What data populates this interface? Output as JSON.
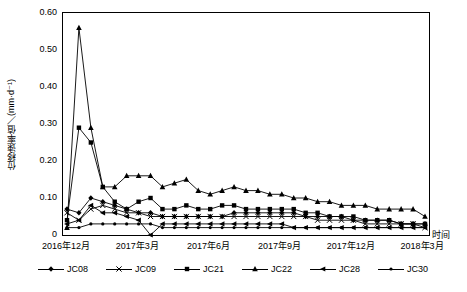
{
  "chart_data": {
    "type": "line",
    "title": "",
    "xlabel": "时间",
    "ylabel": "位移速率值／(mm·d⁻¹)",
    "ylim": [
      0,
      0.6
    ],
    "yticks": [
      "0",
      "0.10",
      "0.20",
      "0.30",
      "0.40",
      "0.50",
      "0.60"
    ],
    "xticks": [
      "2016年12月",
      "2017年3月",
      "2017年6月",
      "2017年9月",
      "2017年12月",
      "2018年3月"
    ],
    "grid": false,
    "legend_position": "bottom",
    "series": [
      {
        "name": "JC08",
        "marker": "diamond",
        "x": [
          0,
          1,
          2,
          3,
          4,
          5,
          6,
          7,
          8,
          9,
          10,
          11,
          12,
          13,
          14,
          15,
          16,
          17,
          18,
          19,
          20,
          21,
          22,
          23,
          24,
          25,
          26,
          27,
          28,
          29,
          30
        ],
        "values": [
          0.07,
          0.06,
          0.1,
          0.09,
          0.08,
          0.07,
          0.06,
          0.06,
          0.05,
          0.05,
          0.05,
          0.05,
          0.05,
          0.05,
          0.06,
          0.06,
          0.06,
          0.06,
          0.06,
          0.06,
          0.05,
          0.05,
          0.05,
          0.05,
          0.04,
          0.04,
          0.04,
          0.04,
          0.03,
          0.03,
          0.03
        ]
      },
      {
        "name": "JC09",
        "marker": "x",
        "x": [
          0,
          1,
          2,
          3,
          4,
          5,
          6,
          7,
          8,
          9,
          10,
          11,
          12,
          13,
          14,
          15,
          16,
          17,
          18,
          19,
          20,
          21,
          22,
          23,
          24,
          25,
          26,
          27,
          28,
          29,
          30
        ],
        "values": [
          0.06,
          0.04,
          0.07,
          0.08,
          0.07,
          0.06,
          0.06,
          0.05,
          0.05,
          0.05,
          0.05,
          0.05,
          0.05,
          0.05,
          0.05,
          0.05,
          0.05,
          0.05,
          0.05,
          0.05,
          0.05,
          0.04,
          0.04,
          0.04,
          0.04,
          0.03,
          0.03,
          0.03,
          0.03,
          0.03,
          0.02
        ]
      },
      {
        "name": "JC21",
        "marker": "square",
        "x": [
          0,
          1,
          2,
          3,
          4,
          5,
          6,
          7,
          8,
          9,
          10,
          11,
          12,
          13,
          14,
          15,
          16,
          17,
          18,
          19,
          20,
          21,
          22,
          23,
          24,
          25,
          26,
          27,
          28,
          29,
          30
        ],
        "values": [
          0.04,
          0.29,
          0.25,
          0.13,
          0.09,
          0.07,
          0.09,
          0.1,
          0.07,
          0.07,
          0.08,
          0.07,
          0.07,
          0.08,
          0.08,
          0.07,
          0.07,
          0.07,
          0.07,
          0.07,
          0.06,
          0.06,
          0.05,
          0.05,
          0.05,
          0.04,
          0.04,
          0.04,
          0.03,
          0.03,
          0.03
        ]
      },
      {
        "name": "JC22",
        "marker": "triangle",
        "x": [
          0,
          1,
          2,
          3,
          4,
          5,
          6,
          7,
          8,
          9,
          10,
          11,
          12,
          13,
          14,
          15,
          16,
          17,
          18,
          19,
          20,
          21,
          22,
          23,
          24,
          25,
          26,
          27,
          28,
          29,
          30
        ],
        "values": [
          0.02,
          0.56,
          0.29,
          0.13,
          0.13,
          0.16,
          0.16,
          0.16,
          0.13,
          0.14,
          0.15,
          0.12,
          0.11,
          0.12,
          0.13,
          0.12,
          0.12,
          0.11,
          0.11,
          0.1,
          0.1,
          0.09,
          0.09,
          0.08,
          0.08,
          0.08,
          0.07,
          0.07,
          0.07,
          0.07,
          0.05
        ]
      },
      {
        "name": "JC28",
        "marker": "left-triangle",
        "x": [
          0,
          1,
          2,
          3,
          4,
          5,
          6,
          7,
          8,
          9,
          10,
          11,
          12,
          13,
          14,
          15,
          16,
          17,
          18,
          19,
          20,
          21,
          22,
          23,
          24,
          25,
          26,
          27,
          28,
          29,
          30
        ],
        "values": [
          0.03,
          0.04,
          0.08,
          0.06,
          0.06,
          0.05,
          0.04,
          0.0,
          0.03,
          0.03,
          0.03,
          0.03,
          0.03,
          0.03,
          0.03,
          0.03,
          0.03,
          0.03,
          0.03,
          0.02,
          0.02,
          0.02,
          0.02,
          0.02,
          0.02,
          0.02,
          0.02,
          0.02,
          0.02,
          0.02,
          0.02
        ]
      },
      {
        "name": "JC30",
        "marker": "dot",
        "x": [
          0,
          1,
          2,
          3,
          4,
          5,
          6,
          7,
          8,
          9,
          10,
          11,
          12,
          13,
          14,
          15,
          16,
          17,
          18,
          19,
          20,
          21,
          22,
          23,
          24,
          25,
          26,
          27,
          28,
          29,
          30
        ],
        "values": [
          0.02,
          0.02,
          0.03,
          0.03,
          0.03,
          0.03,
          0.03,
          0.03,
          0.02,
          0.02,
          0.02,
          0.02,
          0.02,
          0.02,
          0.02,
          0.02,
          0.02,
          0.02,
          0.02,
          0.02,
          0.02,
          0.02,
          0.02,
          0.02,
          0.02,
          0.02,
          0.02,
          0.02,
          0.02,
          0.02,
          0.02
        ]
      }
    ]
  },
  "axis": {
    "ylabel": "位移速率值／(mm·d⁻¹)",
    "xlabel": "时间",
    "yticks": [
      "0.60",
      "0.50",
      "0.40",
      "0.30",
      "0.20",
      "0.10",
      "0"
    ],
    "xticks": [
      "2016年12月",
      "2017年3月",
      "2017年6月",
      "2017年9月",
      "2017年12月",
      "2018年3月"
    ]
  },
  "legend": {
    "items": [
      {
        "label": "JC08",
        "marker": "diamond"
      },
      {
        "label": "JC09",
        "marker": "x"
      },
      {
        "label": "JC21",
        "marker": "square"
      },
      {
        "label": "JC22",
        "marker": "triangle"
      },
      {
        "label": "JC28",
        "marker": "left-triangle"
      },
      {
        "label": "JC30",
        "marker": "dot"
      }
    ]
  }
}
